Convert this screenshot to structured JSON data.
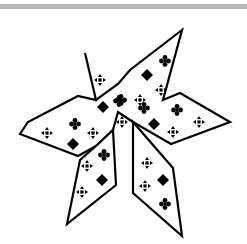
{
  "image": {
    "description": "Black-outlined star-like figure with six pointed arms, filled with small black ornament glyphs",
    "colors": {
      "background": "#ffffff",
      "outline": "#000000",
      "glyph": "#000000",
      "top_bar": "#b5b5b5"
    },
    "glyph_types": [
      "diamond",
      "four-dot-club",
      "dotted-cross"
    ]
  },
  "shape": {
    "upper_body": "85,53 96,100 78,96 28,122 20,134 78,156 96,146 113,130 118,112 133,122 171,144 230,122 180,93 163,100 182,30 130,70 118,84 96,100",
    "lower_left_blade": "113,130 116,185 67,224 80,160 96,146",
    "lower_right_blade": "133,122 173,168 182,236 133,193"
  },
  "glyphs": [
    {
      "type": "dotted-cross",
      "x": 100,
      "y": 80
    },
    {
      "type": "diamond",
      "x": 103,
      "y": 107
    },
    {
      "type": "four-dot-club",
      "x": 119,
      "y": 101
    },
    {
      "type": "four-dot-club",
      "x": 121,
      "y": 100
    },
    {
      "type": "dotted-cross",
      "x": 140,
      "y": 100
    },
    {
      "type": "diamond",
      "x": 147,
      "y": 75
    },
    {
      "type": "four-dot-club",
      "x": 165,
      "y": 61
    },
    {
      "type": "dotted-cross",
      "x": 161,
      "y": 90
    },
    {
      "type": "four-dot-club",
      "x": 144,
      "y": 108
    },
    {
      "type": "dotted-cross",
      "x": 122,
      "y": 122
    },
    {
      "type": "diamond",
      "x": 154,
      "y": 124
    },
    {
      "type": "dotted-cross",
      "x": 173,
      "y": 132
    },
    {
      "type": "four-dot-club",
      "x": 177,
      "y": 110
    },
    {
      "type": "dotted-cross",
      "x": 199,
      "y": 122
    },
    {
      "type": "dotted-cross",
      "x": 47,
      "y": 133
    },
    {
      "type": "four-dot-club",
      "x": 75,
      "y": 124
    },
    {
      "type": "dotted-cross",
      "x": 93,
      "y": 133
    },
    {
      "type": "diamond",
      "x": 73,
      "y": 144
    },
    {
      "type": "four-dot-club",
      "x": 104,
      "y": 155
    },
    {
      "type": "dotted-cross",
      "x": 87,
      "y": 166
    },
    {
      "type": "diamond",
      "x": 102,
      "y": 180
    },
    {
      "type": "dotted-cross",
      "x": 82,
      "y": 192
    },
    {
      "type": "dotted-cross",
      "x": 147,
      "y": 163
    },
    {
      "type": "diamond",
      "x": 163,
      "y": 180
    },
    {
      "type": "dotted-cross",
      "x": 145,
      "y": 186
    },
    {
      "type": "four-dot-club",
      "x": 165,
      "y": 204
    }
  ]
}
